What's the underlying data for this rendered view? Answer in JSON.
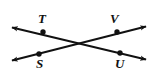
{
  "figure": {
    "type": "geometry-diagram",
    "width": 159,
    "height": 80,
    "background_color": "#ffffff",
    "stroke_color": "#111111",
    "stroke_width": 2,
    "point_radius": 2.6,
    "intersection": {
      "x": 79,
      "y": 42
    },
    "lines": [
      {
        "name": "line-S-V",
        "from": {
          "x": 6,
          "y": 62
        },
        "to": {
          "x": 152,
          "y": 25
        },
        "arrow_start": true,
        "arrow_end": true
      },
      {
        "name": "line-T-U",
        "from": {
          "x": 6,
          "y": 26
        },
        "to": {
          "x": 152,
          "y": 61
        },
        "arrow_start": true,
        "arrow_end": true
      }
    ],
    "points": [
      {
        "id": "T",
        "label": "T",
        "x": 43,
        "y": 32,
        "label_x": 38,
        "label_y": 14,
        "on_line": "line-T-U"
      },
      {
        "id": "V",
        "label": "V",
        "x": 117,
        "y": 32,
        "label_x": 110,
        "label_y": 14,
        "on_line": "line-S-V"
      },
      {
        "id": "S",
        "label": "S",
        "x": 39,
        "y": 54,
        "label_x": 36,
        "label_y": 58,
        "on_line": "line-S-V"
      },
      {
        "id": "U",
        "label": "U",
        "x": 120,
        "y": 53,
        "label_x": 115,
        "label_y": 58,
        "on_line": "line-T-U"
      }
    ]
  }
}
